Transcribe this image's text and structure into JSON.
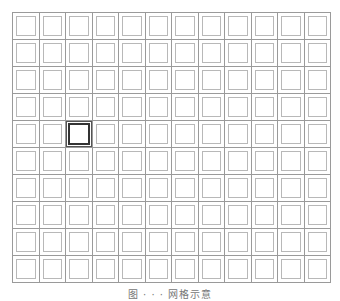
{
  "diagram": {
    "type": "grid",
    "columns": 12,
    "rows": 10,
    "cell_style": "double-outlined square",
    "line_color": "#9a9a9a",
    "inner_square_color": "#b8b8b8",
    "selected_cell": {
      "row": 4,
      "column": 2,
      "color": "#333333"
    }
  },
  "caption": {
    "text": "图 · · · 网格示意"
  }
}
